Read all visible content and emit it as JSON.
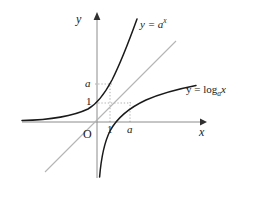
{
  "figure": {
    "kind": "math-graph",
    "axes": {
      "x_axis_label": "x",
      "y_axis_label": "y",
      "origin_label": "O",
      "x_axis_y_px": 122,
      "y_axis_x_px": 97
    },
    "tick_labels": {
      "y_upper": "a",
      "y_lower": "1",
      "x_first": "1",
      "x_second": "a"
    },
    "curves": [
      {
        "id": "exponential",
        "label_prefix": "y = ",
        "label_base": "a",
        "label_exponent": "x",
        "label_plain": "y = a^x",
        "color": "#1a1a1a"
      },
      {
        "id": "logarithmic",
        "label_prefix": "y = log",
        "label_subscript": "a",
        "label_argument": "x",
        "label_plain": "y = log_a x",
        "color": "#1a1a1a"
      },
      {
        "id": "identity-line",
        "label_plain": "y = x",
        "color": "#b4b4b4"
      }
    ],
    "guide_lines": {
      "style": "dotted",
      "color": "#9a9a9a",
      "horizontal_levels": [
        "a",
        "1"
      ],
      "vertical_positions": [
        "1",
        "a"
      ]
    },
    "colors": {
      "background": "#ffffff",
      "curve": "#1a1a1a",
      "axis": "#8c8c8c",
      "identity": "#b4b4b4",
      "guide": "#9a9a9a",
      "text": "#202020"
    }
  }
}
